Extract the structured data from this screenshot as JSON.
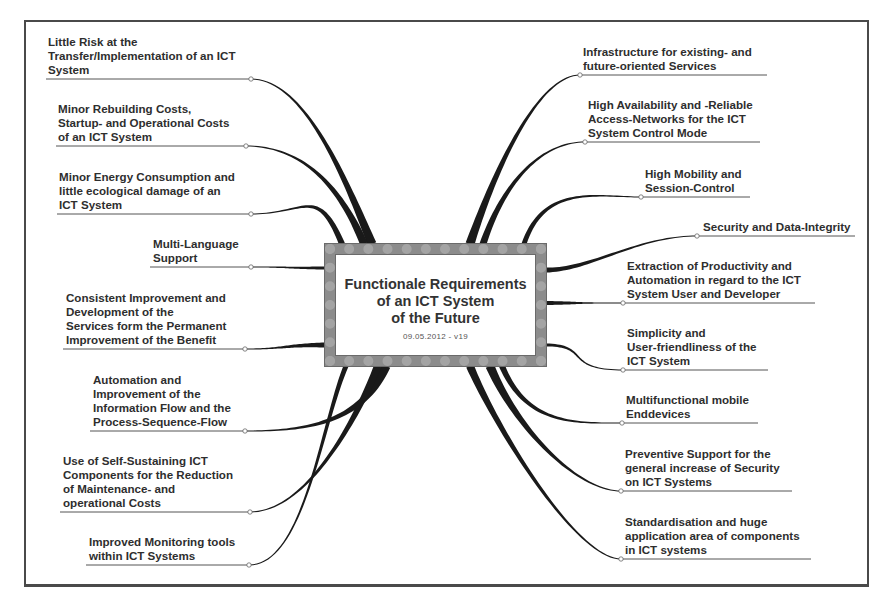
{
  "diagram": {
    "type": "mind-map",
    "center": {
      "title": "Functionale Requirements\nof an ICT System\nof the Future",
      "subtitle": "09.05.2012 - v19"
    },
    "left_branches": [
      {
        "label": "Little Risk at the\nTransfer/Implementation of an ICT\nSystem",
        "line_y": 79,
        "text_x": 48,
        "node_x": 251,
        "line_start": 46
      },
      {
        "label": "Minor Rebuilding Costs,\nStartup- and Operational Costs\nof an ICT System",
        "line_y": 146,
        "text_x": 58,
        "node_x": 246,
        "line_start": 56
      },
      {
        "label": "Minor Energy Consumption and\nlittle ecological damage of an\nICT System",
        "line_y": 214,
        "text_x": 59,
        "node_x": 251,
        "line_start": 57
      },
      {
        "label": "Multi-Language\nSupport",
        "line_y": 267,
        "text_x": 153,
        "node_x": 251,
        "line_start": 150
      },
      {
        "label": "Consistent Improvement and\nDevelopment of the\nServices form the Permanent\nImprovement of the Benefit",
        "line_y": 349,
        "text_x": 66,
        "node_x": 245,
        "line_start": 63
      },
      {
        "label": "Automation and\nImprovement of the\nInformation Flow and the\nProcess-Sequence-Flow",
        "line_y": 431,
        "text_x": 93,
        "node_x": 245,
        "line_start": 90
      },
      {
        "label": "Use of Self-Sustaining ICT\nComponents for the Reduction\nof Maintenance- and\noperational Costs",
        "line_y": 512,
        "text_x": 63,
        "node_x": 250,
        "line_start": 60
      },
      {
        "label": "Improved Monitoring tools\nwithin ICT Systems",
        "line_y": 565,
        "text_x": 89,
        "node_x": 249,
        "line_start": 86
      }
    ],
    "right_branches": [
      {
        "label": "Infrastructure for existing- and\nfuture-oriented Services",
        "line_y": 75,
        "text_x": 583,
        "node_x": 580,
        "line_end": 767
      },
      {
        "label": "High Availability and -Reliable\nAccess-Networks for the ICT\nSystem Control Mode",
        "line_y": 142,
        "text_x": 588,
        "node_x": 585,
        "line_end": 760
      },
      {
        "label": "High Mobility and\nSession-Control",
        "line_y": 197,
        "text_x": 645,
        "node_x": 641,
        "line_end": 750
      },
      {
        "label": "Security and Data-Integrity",
        "line_y": 236,
        "text_x": 703,
        "node_x": 697,
        "line_end": 855
      },
      {
        "label": "Extraction of Productivity and\nAutomation in regard to the ICT\nSystem User and Developer",
        "line_y": 303,
        "text_x": 627,
        "node_x": 623,
        "line_end": 815
      },
      {
        "label": "Simplicity and\nUser-friendliness of the\nICT System",
        "line_y": 370,
        "text_x": 627,
        "node_x": 623,
        "line_end": 768
      },
      {
        "label": "Multifunctional mobile\nEnddevices",
        "line_y": 423,
        "text_x": 626,
        "node_x": 622,
        "line_end": 758
      },
      {
        "label": "Preventive Support for the\ngeneral increase of Security\non ICT Systems",
        "line_y": 491,
        "text_x": 625,
        "node_x": 621,
        "line_end": 792
      },
      {
        "label": "Standardisation and huge\napplication area of components\nin ICT systems",
        "line_y": 559,
        "text_x": 625,
        "node_x": 621,
        "line_end": 811
      }
    ],
    "colors": {
      "line": "#1a1a1a",
      "text": "#2e2e2e",
      "frame": "#4a4a4a",
      "center_border": "#8c8c8c"
    }
  }
}
